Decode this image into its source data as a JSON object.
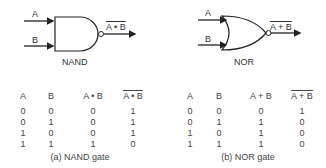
{
  "nand": {
    "input_a": "A",
    "input_b": "B",
    "output": "A • B",
    "gate_label": "NAND",
    "table": {
      "headers": [
        "A",
        "B",
        "A • B",
        "A • B"
      ],
      "rows": [
        [
          "0",
          "0",
          "0",
          "1"
        ],
        [
          "0",
          "1",
          "0",
          "1"
        ],
        [
          "1",
          "0",
          "0",
          "1"
        ],
        [
          "1",
          "1",
          "1",
          "0"
        ]
      ]
    },
    "caption": "(a) NAND gate"
  },
  "nor": {
    "input_a": "A",
    "input_b": "B",
    "output": "A + B",
    "gate_label": "NOR",
    "table": {
      "headers": [
        "A",
        "B",
        "A + B",
        "A + B"
      ],
      "rows": [
        [
          "0",
          "0",
          "0",
          "1"
        ],
        [
          "0",
          "1",
          "1",
          "0"
        ],
        [
          "1",
          "0",
          "1",
          "0"
        ],
        [
          "1",
          "1",
          "1",
          "0"
        ]
      ]
    },
    "caption": "(b) NOR gate"
  }
}
